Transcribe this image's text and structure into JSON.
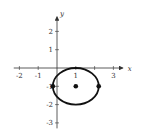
{
  "chart_data": {
    "type": "scatter",
    "title": "",
    "xlabel": "x",
    "ylabel": "y",
    "xlim": [
      -2.3,
      3.5
    ],
    "ylim": [
      -3.3,
      2.8
    ],
    "grid": false,
    "x_ticks": [
      -2,
      -1,
      1,
      3
    ],
    "x_tick_labels": [
      "-2",
      "-1",
      "1",
      "3"
    ],
    "y_ticks": [
      2,
      1,
      -1,
      -2,
      -3
    ],
    "y_tick_labels": [
      "2",
      "1",
      "-1",
      "-2",
      "-3"
    ],
    "curves": [
      {
        "name": "ellipse",
        "shape": "ellipse",
        "center": [
          1,
          -1
        ],
        "semi_axis_x": 1.22,
        "semi_axis_y": 1
      }
    ],
    "points": [
      {
        "name": "center",
        "x": 1,
        "y": -1
      },
      {
        "name": "left-vertex",
        "x": -0.22,
        "y": -1
      },
      {
        "name": "right-vertex",
        "x": 2.22,
        "y": -1
      }
    ]
  }
}
